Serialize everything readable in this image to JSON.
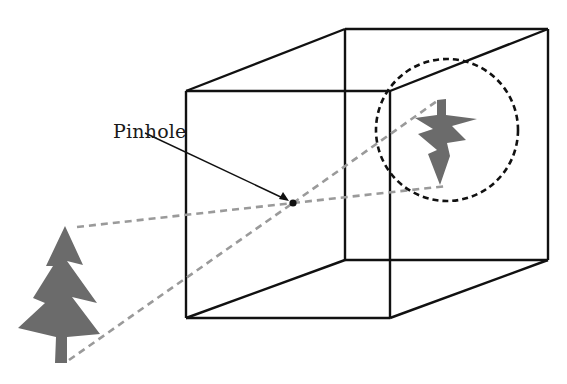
{
  "diagram": {
    "type": "pinhole-camera",
    "labels": {
      "pinhole": "Pinhole"
    },
    "elements": {
      "object": "upright tree (outside box)",
      "image": "inverted tree projected on back wall",
      "box": "camera obscura cube",
      "rays": "dashed light rays through pinhole",
      "highlight": "dashed circle around projected image"
    },
    "colors": {
      "outline": "#111111",
      "tree": "#6b6b6b",
      "ray": "#9a9a9a",
      "background": "#ffffff"
    }
  }
}
